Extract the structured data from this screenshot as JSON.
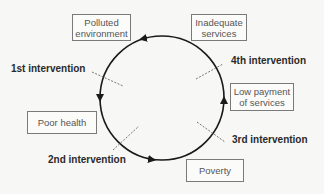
{
  "diagram": {
    "type": "cycle",
    "nodes": [
      {
        "id": "polluted",
        "label": "Polluted\nenvironment"
      },
      {
        "id": "inadequate",
        "label": "Inadequate\nservices"
      },
      {
        "id": "low_payment",
        "label": "Low payment\nof services"
      },
      {
        "id": "poverty",
        "label": "Poverty"
      },
      {
        "id": "poor_health",
        "label": "Poor health"
      }
    ],
    "interventions": [
      {
        "label": "1st intervention"
      },
      {
        "label": "2nd intervention"
      },
      {
        "label": "3rd intervention"
      },
      {
        "label": "4th intervention"
      }
    ],
    "colors": {
      "arrow": "#1a1a1a",
      "dashed": "#666666",
      "box_border": "#7a7a7a",
      "background": "#f7f7f5"
    }
  }
}
